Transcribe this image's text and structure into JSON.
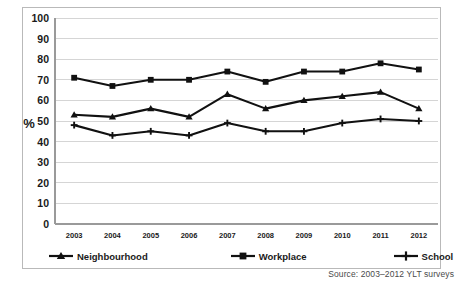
{
  "chart_data": {
    "type": "line",
    "title": "",
    "xlabel": "",
    "ylabel": "%",
    "ylim": [
      0,
      100
    ],
    "ytick_step": 10,
    "grid": true,
    "legend_position": "bottom",
    "categories": [
      "2003",
      "2004",
      "2005",
      "2006",
      "2007",
      "2008",
      "2009",
      "2010",
      "2011",
      "2012"
    ],
    "yticks": [
      "100",
      "90",
      "80",
      "70",
      "60",
      "50",
      "40",
      "30",
      "20",
      "10",
      "0"
    ],
    "series": [
      {
        "name": "Neighbourhood",
        "marker": "triangle",
        "color": "#111111",
        "values": [
          53,
          52,
          56,
          52,
          63,
          56,
          60,
          62,
          64,
          56
        ]
      },
      {
        "name": "Workplace",
        "marker": "square",
        "color": "#111111",
        "values": [
          71,
          67,
          70,
          70,
          74,
          69,
          74,
          74,
          78,
          75
        ]
      },
      {
        "name": "School",
        "marker": "plus",
        "color": "#111111",
        "values": [
          48,
          43,
          45,
          43,
          49,
          45,
          45,
          49,
          51,
          50
        ]
      }
    ],
    "annotations": {
      "source": "Source: 2003–2012 YLT surveys"
    }
  },
  "colors": {
    "line": "#111111",
    "grid": "#d5d5d5",
    "axis": "#9a9a9a",
    "frame": "#b9b9b9",
    "text": "#1a1a1a",
    "source_text": "#4a4a4a"
  }
}
